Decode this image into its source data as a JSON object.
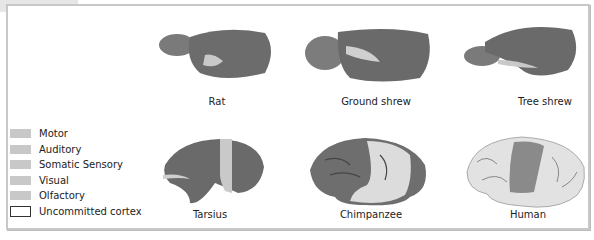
{
  "figure": {
    "legend": [
      {
        "label": "Motor",
        "swatch": "#c4c4c4"
      },
      {
        "label": "Auditory",
        "swatch": "#c8c8c8"
      },
      {
        "label": "Somatic Sensory",
        "swatch": "#cacaca"
      },
      {
        "label": "Visual",
        "swatch": "#c6c6c6"
      },
      {
        "label": "Olfactory",
        "swatch": "#c9c9c9"
      },
      {
        "label": "Uncommitted cortex",
        "swatch": "none"
      }
    ],
    "brains": [
      {
        "name": "Rat"
      },
      {
        "name": "Ground shrew"
      },
      {
        "name": "Tree shrew"
      },
      {
        "name": "Tarsius"
      },
      {
        "name": "Chimpanzee"
      },
      {
        "name": "Human"
      }
    ]
  }
}
